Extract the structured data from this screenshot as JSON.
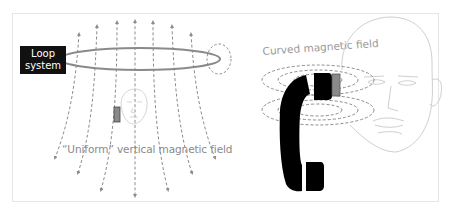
{
  "diagram": {
    "left_panel": {
      "loop_box": {
        "line1": "Loop",
        "line2": "system"
      },
      "caption": "“Uniform” vertical magnetic field",
      "elements": [
        "loop-ring",
        "vertical-field-lines",
        "small-head",
        "hearing-aid-receiver",
        "loop-cross-section-field"
      ]
    },
    "right_panel": {
      "caption": "Curved magnetic field",
      "elements": [
        "large-head",
        "telephone-handset",
        "curved-field-ellipses",
        "hearing-aid-receiver"
      ]
    },
    "colors": {
      "loop_box": "#111111",
      "field_lines": "#8c8c8c",
      "loop_ring": "#888888",
      "receiver": "#888888",
      "face_outline": "#cfcfcf",
      "handset": "#000000",
      "frame_border": "#e6e6e6"
    }
  }
}
